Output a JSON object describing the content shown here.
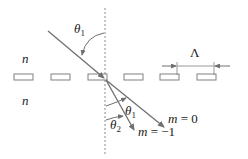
{
  "diagram": {
    "colors": {
      "line": "#707070",
      "grating_stroke": "#808080",
      "normal": "#8a8a8a",
      "text": "#222222",
      "background": "#ffffff"
    },
    "labels": {
      "medium_top": "n",
      "medium_bottom": "n",
      "theta1_incident": "θ",
      "theta1_incident_sub": "1",
      "theta1_diffracted": "θ",
      "theta1_diffracted_sub": "1",
      "theta2": "θ",
      "theta2_sub": "2",
      "period": "Λ",
      "order0_m": "m",
      "order0_eq": " = 0",
      "order_minus1_m": "m",
      "order_minus1_eq": " = −1"
    },
    "grating": {
      "element_count": 6,
      "element_x": [
        14,
        51,
        88,
        124,
        160,
        197
      ],
      "element_y": 74,
      "element_width": 19,
      "element_height": 6
    },
    "rays": [
      {
        "name": "incident",
        "from": [
          48,
          31
        ],
        "to": [
          104,
          78
        ]
      },
      {
        "name": "m=0",
        "from": [
          106,
          80
        ],
        "to": [
          164,
          127
        ]
      },
      {
        "name": "m=-1",
        "from": [
          106,
          80
        ],
        "to": [
          134,
          130
        ]
      }
    ]
  }
}
